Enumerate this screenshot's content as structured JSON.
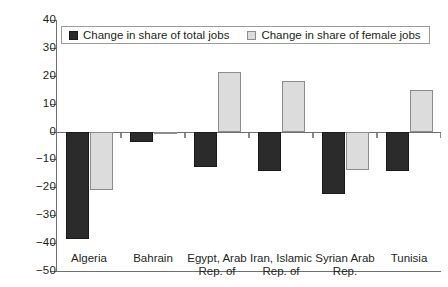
{
  "chart_data": {
    "type": "bar",
    "title": "",
    "subtitle": "",
    "xlabel": "",
    "ylabel": "",
    "ylim": [
      -50,
      40
    ],
    "ytick_values": [
      40,
      30,
      20,
      10,
      0,
      -10,
      -20,
      -30,
      -40,
      -50
    ],
    "ytick_labels": [
      "40",
      "30",
      "20",
      "10",
      "0",
      "−10",
      "−20",
      "−30",
      "−40",
      "−50"
    ],
    "grid": false,
    "legend_position": "top-left-inside",
    "categories": [
      "Algeria",
      "Bahrain",
      "Egypt, Arab Rep. of",
      "Iran, Islamic Rep. of",
      "Syrian Arab Rep.",
      "Tunisia"
    ],
    "category_lines": [
      [
        "Algeria"
      ],
      [
        "Bahrain"
      ],
      [
        "Egypt, Arab",
        "Rep. of"
      ],
      [
        "Iran, Islamic",
        "Rep. of"
      ],
      [
        "Syrian Arab",
        "Rep."
      ],
      [
        "Tunisia"
      ]
    ],
    "series": [
      {
        "name": "Change in share of total jobs",
        "color": "#2b2b2b",
        "values": [
          -38.5,
          -3.8,
          -12.8,
          -14.0,
          -22.5,
          -14.0
        ]
      },
      {
        "name": "Change in share of female jobs",
        "color": "#dcdcdc",
        "values": [
          -20.8,
          -0.3,
          21.5,
          18.0,
          -13.8,
          15.0
        ]
      }
    ]
  },
  "legend": {
    "items": [
      {
        "label": "Change in share of total jobs",
        "swatch": "dark"
      },
      {
        "label": "Change in share of female jobs",
        "swatch": "light"
      }
    ]
  },
  "colors": {
    "series_total_jobs": "#2b2b2b",
    "series_female_jobs": "#dcdcdc",
    "axis": "#6f6f6f",
    "text": "#231f20",
    "background": "#ffffff"
  }
}
